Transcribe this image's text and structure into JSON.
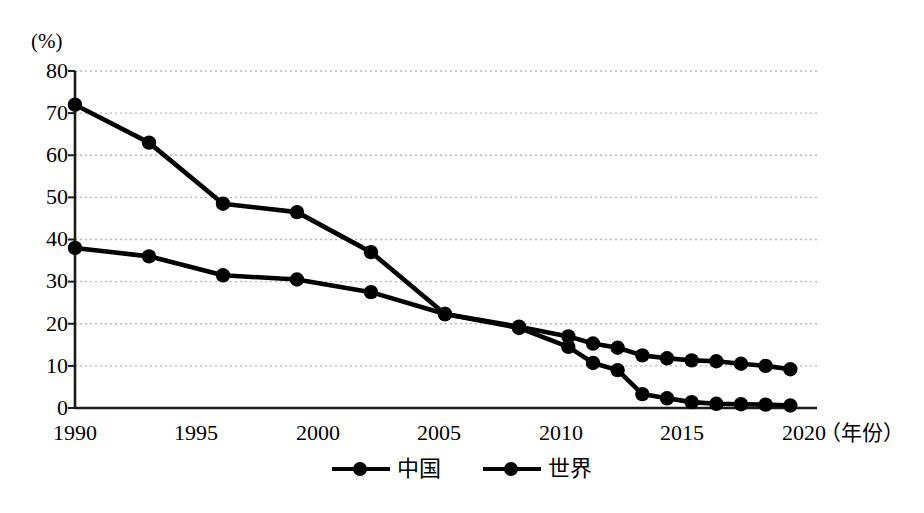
{
  "chart_data": {
    "type": "line",
    "title": "",
    "xlabel": "（年份）",
    "ylabel": "(%)",
    "xlim": [
      1990,
      2020
    ],
    "ylim": [
      0,
      80
    ],
    "yticks": [
      0,
      10,
      20,
      30,
      40,
      50,
      60,
      70,
      80
    ],
    "xticks": [
      1990,
      1995,
      2000,
      2005,
      2010,
      2015,
      2020
    ],
    "grid": "horizontal-dotted",
    "legend_position": "bottom-center",
    "series": [
      {
        "name": "中国",
        "x": [
          1990,
          1993,
          1996,
          1999,
          2002,
          2005,
          2008,
          2010,
          2011,
          2012,
          2013,
          2014,
          2015,
          2016,
          2017,
          2018,
          2019
        ],
        "values": [
          72,
          63,
          48.5,
          46.5,
          37,
          22.3,
          19,
          14.5,
          10.7,
          9,
          3.3,
          2.3,
          1.4,
          1,
          0.9,
          0.8,
          0.6
        ]
      },
      {
        "name": "世界",
        "x": [
          1990,
          1993,
          1996,
          1999,
          2002,
          2005,
          2008,
          2010,
          2011,
          2012,
          2013,
          2014,
          2015,
          2016,
          2017,
          2018,
          2019
        ],
        "values": [
          38,
          36,
          31.5,
          30.5,
          27.5,
          22.3,
          19.3,
          17,
          15.3,
          14.3,
          12.5,
          11.8,
          11.3,
          11.1,
          10.5,
          10,
          9.2
        ]
      }
    ]
  },
  "axes": {
    "unit_label": "(%)",
    "x_title": "（年份）",
    "ytick_labels": [
      "80",
      "70",
      "60",
      "50",
      "40",
      "30",
      "20",
      "10",
      "0"
    ],
    "xtick_labels": [
      "1990",
      "1995",
      "2000",
      "2005",
      "2010",
      "2015",
      "2020"
    ]
  },
  "legend": {
    "items": [
      {
        "label": "中国",
        "color": "#000000"
      },
      {
        "label": "世界",
        "color": "#000000"
      }
    ]
  },
  "style": {
    "line_color": "#000000",
    "grid_color": "#b9b9b9",
    "axis_color": "#1a1a1a",
    "background": "#ffffff"
  }
}
